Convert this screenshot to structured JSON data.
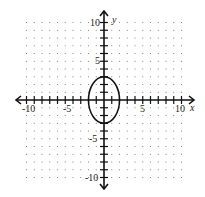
{
  "chart_data": {
    "type": "scatter",
    "title": "",
    "xlabel": "x",
    "ylabel": "y",
    "xlim": [
      -11,
      11
    ],
    "ylim": [
      -11,
      11
    ],
    "grid": "dotted",
    "x_tick_labels": [
      "-10",
      "-5",
      "5",
      "10"
    ],
    "y_tick_labels": [
      "10",
      "5",
      "-5",
      "-10"
    ],
    "series": [
      {
        "name": "ellipse",
        "shape": "ellipse",
        "center": [
          0,
          0
        ],
        "semi_axis_x": 2,
        "semi_axis_y": 3,
        "equation": "x^2/4 + y^2/9 = 1"
      }
    ]
  },
  "labels": {
    "x_axis": "x",
    "y_axis": "y",
    "xt_m10": "-10",
    "xt_m5": "-5",
    "xt_5": "5",
    "xt_10": "10",
    "yt_10": "10",
    "yt_5": "5",
    "yt_m5": "-5",
    "yt_m10": "-10"
  }
}
